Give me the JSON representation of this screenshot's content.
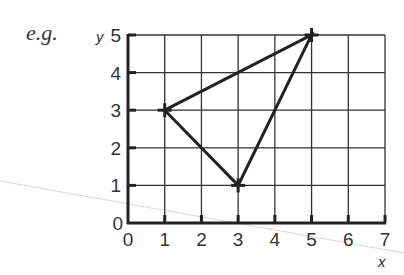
{
  "label": "e.g.",
  "chart_data": {
    "type": "line",
    "title": "",
    "xlabel": "x",
    "ylabel": "y",
    "xlim": [
      0,
      7
    ],
    "ylim": [
      0,
      5
    ],
    "grid": true,
    "x_ticks": [
      "0",
      "1",
      "2",
      "3",
      "4",
      "5",
      "6",
      "7"
    ],
    "y_ticks": [
      "0",
      "1",
      "2",
      "3",
      "4",
      "5"
    ],
    "series": [
      {
        "name": "triangle",
        "closed": true,
        "points": [
          {
            "x": 1,
            "y": 3
          },
          {
            "x": 5,
            "y": 5
          },
          {
            "x": 3,
            "y": 1
          }
        ]
      }
    ]
  },
  "colors": {
    "ink": "#222222",
    "grid": "#333333"
  }
}
